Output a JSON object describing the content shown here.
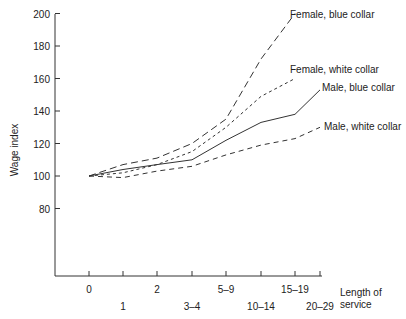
{
  "chart_data": {
    "type": "line",
    "title": "",
    "xlabel": "Length of service",
    "xlabel_lines": [
      "Length of",
      "service"
    ],
    "ylabel": "Wage index",
    "ylim": [
      80,
      200
    ],
    "yticks": [
      80,
      100,
      120,
      140,
      160,
      180,
      200
    ],
    "categories": [
      "0",
      "1",
      "2",
      "3–4",
      "5–9",
      "10–14",
      "15–19",
      "20–29"
    ],
    "grid": false,
    "legend_position": "inline labels at line ends",
    "series": [
      {
        "name": "Female, blue collar",
        "style": "long-dash",
        "values": [
          100,
          107,
          111,
          120,
          135,
          172,
          200,
          null
        ]
      },
      {
        "name": "Female, white collar",
        "style": "dotted",
        "values": [
          100,
          102,
          107,
          115,
          130,
          149,
          160,
          null
        ]
      },
      {
        "name": "Male, blue collar",
        "style": "solid",
        "values": [
          100,
          104,
          107,
          110,
          122,
          133,
          138,
          153
        ]
      },
      {
        "name": "Male, white collar",
        "style": "dashed",
        "values": [
          100,
          99,
          103,
          106,
          113,
          119,
          123,
          130
        ]
      }
    ]
  }
}
